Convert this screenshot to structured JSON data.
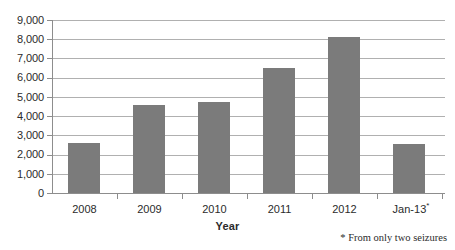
{
  "chart_data": {
    "type": "bar",
    "title": "",
    "subtitle": "",
    "xlabel": "Year",
    "ylabel": "",
    "categories": [
      "2008",
      "2009",
      "2010",
      "2011",
      "2012",
      "Jan-13*"
    ],
    "category_labels_plain": [
      "2008",
      "2009",
      "2010",
      "2011",
      "2012",
      "Jan-13"
    ],
    "values": [
      2620,
      4600,
      4750,
      6500,
      8100,
      2550
    ],
    "series": [
      {
        "name": "Seizures",
        "values": [
          2620,
          4600,
          4750,
          6500,
          8100,
          2550
        ]
      }
    ],
    "ylim": [
      0,
      9000
    ],
    "ytick_step": 1000,
    "ytick_labels": [
      "9,000",
      "8,000",
      "7,000",
      "6,000",
      "5,000",
      "4,000",
      "3,000",
      "2,000",
      "1,000",
      "0"
    ],
    "ytick_values": [
      9000,
      8000,
      7000,
      6000,
      5000,
      4000,
      3000,
      2000,
      1000,
      0
    ],
    "grid": true,
    "grid_axis": "y",
    "legend": false,
    "legend_position": "none",
    "annotations": [
      "* From only two seizures"
    ],
    "bar_color": "#7b7b7b",
    "grid_color": "#b0b0b0",
    "axis_color": "#8d8d8d",
    "text_color": "#2b2b2b",
    "background_color": "#ffffff"
  },
  "footnote": {
    "marker": "*",
    "text": "* From only two seizures"
  },
  "axis": {
    "x_title": "Year"
  }
}
